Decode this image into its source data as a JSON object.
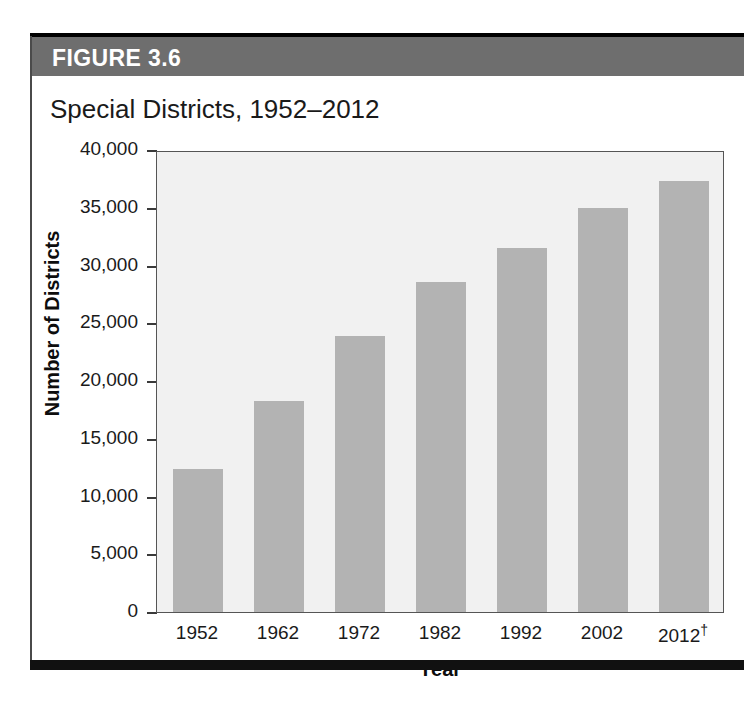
{
  "figure": {
    "number_label": "FIGURE 3.6",
    "title": "Special Districts, 1952–2012"
  },
  "colors": {
    "header_band": "#6e6e6e",
    "bar_fill": "#b3b3b3",
    "plot_background": "#f1f1f1",
    "axis_line": "#555555",
    "text": "#1a1a1a",
    "header_text": "#ffffff",
    "bottom_rule": "#111111"
  },
  "chart_data": {
    "type": "bar",
    "title": "Special Districts, 1952–2012",
    "xlabel": "Year",
    "ylabel": "Number of Districts",
    "categories": [
      "1952",
      "1962",
      "1972",
      "1982",
      "1992",
      "2002",
      "2012†"
    ],
    "values": [
      12400,
      18300,
      23900,
      28600,
      31500,
      35000,
      37300
    ],
    "ylim": [
      0,
      40000
    ],
    "yticks": [
      0,
      5000,
      10000,
      15000,
      20000,
      25000,
      30000,
      35000,
      40000
    ],
    "ytick_labels": [
      "0",
      "5,000",
      "10,000",
      "15,000",
      "20,000",
      "25,000",
      "30,000",
      "35,000",
      "40,000"
    ],
    "grid": false,
    "legend": false,
    "note_marker": "†"
  }
}
